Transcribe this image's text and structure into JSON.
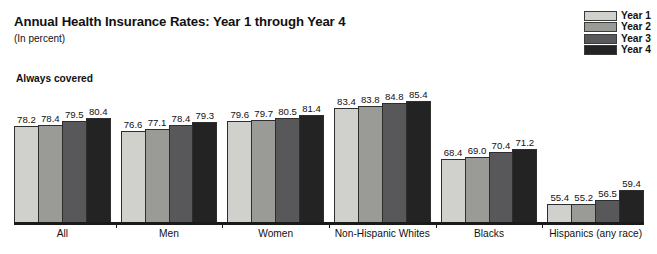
{
  "header": {
    "title": "Annual Health Insurance Rates: Year 1 through Year 4",
    "subtitle": "(In percent)",
    "section_label": "Always covered"
  },
  "legend": {
    "position": "top-right",
    "entries": [
      {
        "label": "Year 1",
        "color": "#d0d0cd"
      },
      {
        "label": "Year 2",
        "color": "#9a9a97"
      },
      {
        "label": "Year 3",
        "color": "#58585a"
      },
      {
        "label": "Year 4",
        "color": "#232323"
      }
    ]
  },
  "chart_data": {
    "type": "bar",
    "title": "Annual Health Insurance Rates: Year 1 through Year 4",
    "subtitle": "(In percent)",
    "xlabel": "",
    "ylabel": "",
    "grid": false,
    "legend_position": "top-right",
    "axis_truncated": true,
    "value_axis_visual_range": [
      50,
      88
    ],
    "categories": [
      "All",
      "Men",
      "Women",
      "Non-Hispanic Whites",
      "Blacks",
      "Hispanics (any race)"
    ],
    "series": [
      {
        "name": "Year 1",
        "color": "#d0d0cd",
        "values": [
          78.2,
          76.6,
          79.6,
          83.4,
          68.4,
          55.4
        ]
      },
      {
        "name": "Year 2",
        "color": "#9a9a97",
        "values": [
          78.4,
          77.1,
          79.7,
          83.8,
          69.0,
          55.2
        ]
      },
      {
        "name": "Year 3",
        "color": "#58585a",
        "values": [
          79.5,
          78.4,
          80.5,
          84.8,
          70.4,
          56.5
        ]
      },
      {
        "name": "Year 4",
        "color": "#232323",
        "values": [
          80.4,
          79.3,
          81.4,
          85.4,
          71.2,
          59.4
        ]
      }
    ],
    "value_labels": [
      [
        "78.2",
        "78.4",
        "79.5",
        "80.4"
      ],
      [
        "76.6",
        "77.1",
        "78.4",
        "79.3"
      ],
      [
        "79.6",
        "79.7",
        "80.5",
        "81.4"
      ],
      [
        "83.4",
        "83.8",
        "84.8",
        "85.4"
      ],
      [
        "68.4",
        "69.0",
        "70.4",
        "71.2"
      ],
      [
        "55.4",
        "55.2",
        "56.5",
        "59.4"
      ]
    ]
  }
}
